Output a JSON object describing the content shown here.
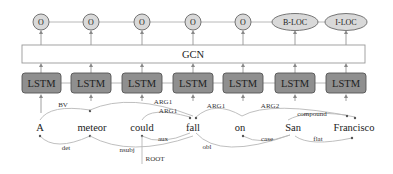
{
  "diagram": {
    "gcn_label": "GCN",
    "cell_label": "LSTM",
    "colors": {
      "tag_fill": "#d9d9d9",
      "tag_stroke": "#666666",
      "lstm_fill": "#8f8f8f",
      "lstm_stroke": "#555555",
      "gcn_stroke": "#999999",
      "arc": "#b8b8b8"
    },
    "tokens": [
      {
        "word": "A",
        "tag": "O",
        "x": 41,
        "word_x": 40
      },
      {
        "word": "meteor",
        "tag": "O",
        "x": 91,
        "word_x": 92
      },
      {
        "word": "could",
        "tag": "O",
        "x": 142,
        "word_x": 142
      },
      {
        "word": "fall",
        "tag": "O",
        "x": 193,
        "word_x": 193
      },
      {
        "word": "on",
        "tag": "O",
        "x": 243,
        "word_x": 240
      },
      {
        "word": "San",
        "tag": "B-LOC",
        "x": 295,
        "word_x": 293
      },
      {
        "word": "Francisco",
        "tag": "I-LOC",
        "x": 346,
        "word_x": 354
      }
    ],
    "semantic_edges": [
      {
        "label": "BV",
        "from": "A",
        "to": "meteor"
      },
      {
        "label": "ARG1",
        "from": "meteor",
        "to": "fall"
      },
      {
        "label": "ARG1",
        "from": "could",
        "to": "fall"
      },
      {
        "label": "ARG1",
        "from": "fall",
        "to": "on"
      },
      {
        "label": "ARG2",
        "from": "on",
        "to": "Francisco"
      },
      {
        "label": "compound",
        "from": "San",
        "to": "Francisco"
      }
    ],
    "syntactic_edges": [
      {
        "label": "det",
        "from": "meteor",
        "to": "A"
      },
      {
        "label": "nsubj",
        "from": "fall",
        "to": "meteor"
      },
      {
        "label": "aux",
        "from": "fall",
        "to": "could"
      },
      {
        "label": "obl",
        "from": "fall",
        "to": "San"
      },
      {
        "label": "case",
        "from": "San",
        "to": "on"
      },
      {
        "label": "flat",
        "from": "San",
        "to": "Francisco"
      }
    ],
    "root_label": "ROOT"
  }
}
